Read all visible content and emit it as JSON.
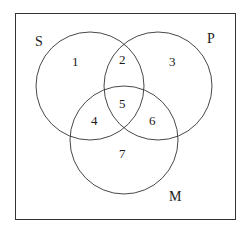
{
  "diagram": {
    "type": "venn",
    "sets": [
      {
        "name": "S",
        "label": "S"
      },
      {
        "name": "P",
        "label": "P"
      },
      {
        "name": "M",
        "label": "M"
      }
    ],
    "regions": [
      {
        "id": "1",
        "label": "1",
        "sets": [
          "S"
        ]
      },
      {
        "id": "2",
        "label": "2",
        "sets": [
          "S",
          "P"
        ]
      },
      {
        "id": "3",
        "label": "3",
        "sets": [
          "P"
        ]
      },
      {
        "id": "4",
        "label": "4",
        "sets": [
          "S",
          "M"
        ]
      },
      {
        "id": "5",
        "label": "5",
        "sets": [
          "S",
          "P",
          "M"
        ]
      },
      {
        "id": "6",
        "label": "6",
        "sets": [
          "P",
          "M"
        ]
      },
      {
        "id": "7",
        "label": "7",
        "sets": [
          "M"
        ]
      }
    ],
    "colors": {
      "stroke": "#333333",
      "background": "#ffffff"
    }
  }
}
